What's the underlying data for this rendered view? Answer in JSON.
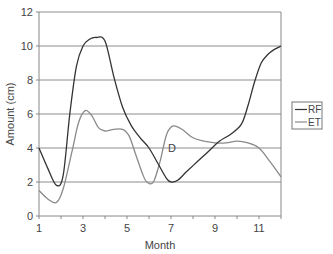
{
  "chart_data": {
    "type": "line",
    "title": "",
    "xlabel": "Month",
    "ylabel": "Amount (cm)",
    "xlim": [
      1,
      12
    ],
    "ylim": [
      0,
      12
    ],
    "x_ticks": [
      1,
      3,
      5,
      7,
      9,
      11
    ],
    "y_ticks": [
      0,
      2,
      4,
      6,
      8,
      10,
      12
    ],
    "grid": "horizontal",
    "legend_position": "right",
    "annotations": [
      {
        "text": "D",
        "x": 7.0,
        "y": 4.0
      }
    ],
    "series": [
      {
        "name": "RF",
        "color": "#333333",
        "x": [
          1,
          1.4,
          1.8,
          2.1,
          2.4,
          2.7,
          3.0,
          3.3,
          3.6,
          4.0,
          4.4,
          4.8,
          5.2,
          5.6,
          6.0,
          6.4,
          6.8,
          7.0,
          7.3,
          7.7,
          8.2,
          8.7,
          9.2,
          9.7,
          10.2,
          10.5,
          10.8,
          11.1,
          11.4,
          11.7,
          12.0
        ],
        "values": [
          4.0,
          2.8,
          1.8,
          2.4,
          6.0,
          8.8,
          10.0,
          10.4,
          10.5,
          10.3,
          8.2,
          6.4,
          5.3,
          4.6,
          4.0,
          3.1,
          2.2,
          2.0,
          2.1,
          2.6,
          3.2,
          3.8,
          4.4,
          4.8,
          5.4,
          6.5,
          7.9,
          9.0,
          9.5,
          9.8,
          10.0
        ]
      },
      {
        "name": "ET",
        "color": "#8a8a8a",
        "x": [
          1,
          1.4,
          1.8,
          2.1,
          2.5,
          2.8,
          3.1,
          3.4,
          3.7,
          4.0,
          4.4,
          4.8,
          5.1,
          5.4,
          5.7,
          5.9,
          6.2,
          6.5,
          6.8,
          7.1,
          7.5,
          8.0,
          8.5,
          9.0,
          9.5,
          10.0,
          10.5,
          11.0,
          11.5,
          12.0
        ],
        "values": [
          1.5,
          1.0,
          0.8,
          1.6,
          3.8,
          5.5,
          6.2,
          5.9,
          5.2,
          5.0,
          5.1,
          5.1,
          4.7,
          3.6,
          2.5,
          2.0,
          2.0,
          3.2,
          4.8,
          5.3,
          5.1,
          4.6,
          4.4,
          4.3,
          4.3,
          4.4,
          4.3,
          4.0,
          3.2,
          2.3
        ]
      }
    ]
  },
  "legend": {
    "items": [
      {
        "label": "RF",
        "color": "#333333"
      },
      {
        "label": "ET",
        "color": "#8a8a8a"
      }
    ]
  },
  "labels": {
    "xlabel": "Month",
    "ylabel": "Amount (cm)",
    "annotation": "D"
  }
}
